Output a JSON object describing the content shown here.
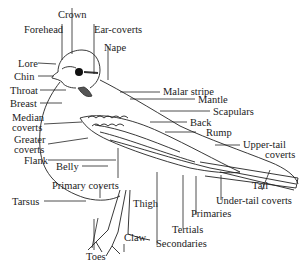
{
  "diagram": {
    "labels": {
      "crown": "Crown",
      "forehead": "Forehead",
      "ear_coverts": "Ear-coverts",
      "nape": "Nape",
      "lore": "Lore",
      "chin": "Chin",
      "throat": "Throat",
      "breast": "Breast",
      "median_coverts_1": "Median",
      "median_coverts_2": "coverts",
      "greater_coverts_1": "Greater",
      "greater_coverts_2": "coverts",
      "flank": "Flank",
      "belly": "Belly",
      "primary_coverts": "Primary coverts",
      "tarsus": "Tarsus",
      "thigh": "Thigh",
      "claw": "Claw",
      "toes": "Toes",
      "malar_stripe": "Malar stripe",
      "mantle": "Mantle",
      "scapulars": "Scapulars",
      "back": "Back",
      "rump": "Rump",
      "upper_tail_coverts_1": "Upper-tail",
      "upper_tail_coverts_2": "coverts",
      "tail": "Tail",
      "under_tail_coverts": "Under-tail coverts",
      "primaries": "Primaries",
      "tertials": "Tertials",
      "secondaries": "Secondaries"
    }
  }
}
